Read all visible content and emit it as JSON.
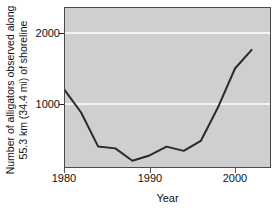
{
  "chart_data": {
    "type": "line",
    "title": "",
    "xlabel": "Year",
    "ylabel_line1": "Number of alligators observed along",
    "ylabel_line2": "55.3 km (34.4 mi) of shoreline",
    "xlim": [
      1979,
      2003.5
    ],
    "ylim": [
      0,
      2300
    ],
    "xticks": [
      1980,
      1990,
      2000
    ],
    "xtick_labels": [
      "1980",
      "1990",
      "2000"
    ],
    "yticks": [
      1000,
      2000
    ],
    "ytick_labels": [
      "1000",
      "2000"
    ],
    "grid": "horizontal-white-gridlines",
    "gridlines_at": [
      1000,
      2000
    ],
    "legend": "none",
    "plot_background": "#cfcfcf",
    "line_color": "#2b2b2b",
    "line_width": 2,
    "x": [
      1980,
      1982,
      1984,
      1986,
      1988,
      1990,
      1992,
      1994,
      1996,
      1998,
      2000,
      2002
    ],
    "values": [
      1210,
      880,
      400,
      375,
      200,
      275,
      400,
      340,
      480,
      950,
      1500,
      1770
    ],
    "series": [
      {
        "name": "Alligators observed",
        "x": [
          1980,
          1982,
          1984,
          1986,
          1988,
          1990,
          1992,
          1994,
          1996,
          1998,
          2000,
          2002
        ],
        "values": [
          1210,
          880,
          400,
          375,
          200,
          275,
          400,
          340,
          480,
          950,
          1500,
          1770
        ]
      }
    ],
    "annotations": []
  },
  "axes": {
    "y_title_line1": "Number of alligators observed along",
    "y_title_line2": "55.3 km (34.4 mi) of shoreline",
    "x_title": "Year",
    "ytick_1": "1000",
    "ytick_2": "2000",
    "xtick_1": "1980",
    "xtick_2": "1990",
    "xtick_3": "2000"
  }
}
